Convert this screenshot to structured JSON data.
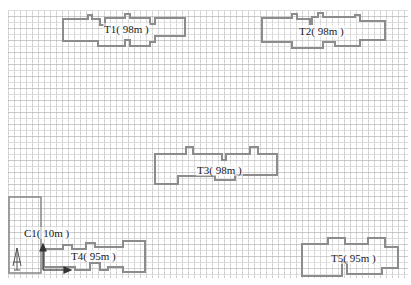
{
  "diagram": {
    "type": "site-plan",
    "background": "dashed grid",
    "colors": {
      "outline": "#8c8c8c",
      "grid": "#999999",
      "text": "#1a1a1a",
      "axis": "#333333"
    },
    "buildings": [
      {
        "id": "T1",
        "label": "T1( 98m )",
        "height_m": 98
      },
      {
        "id": "T2",
        "label": "T2( 98m )",
        "height_m": 98
      },
      {
        "id": "T3",
        "label": "T3( 98m )",
        "height_m": 98
      },
      {
        "id": "T4",
        "label": "T4( 95m )",
        "height_m": 95
      },
      {
        "id": "T5",
        "label": "T5( 95m )",
        "height_m": 95
      }
    ],
    "crane": {
      "id": "C1",
      "label": "C1( 10m )",
      "height_m": 10
    },
    "axis": {
      "icon": "north-arrow-icon"
    }
  }
}
